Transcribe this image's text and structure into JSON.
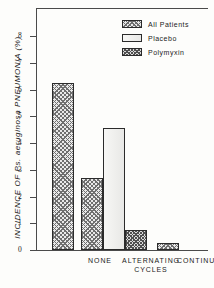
{
  "chart_data": {
    "type": "bar",
    "title": "",
    "xlabel": "",
    "ylabel": "INCIDENCE OF Ps. aeruginosa PNEUMONIA (%)",
    "ylabel_parts": {
      "prefix": "INCIDENCE OF ",
      "species": "Ps. aeruginosa",
      "suffix": " PNEUMONIA (%)"
    },
    "categories": [
      "NONE",
      "ALTERNATING\nCYCLES",
      "CONTINUOUS"
    ],
    "category_labels_flat": [
      "NONE",
      "ALTERNATING CYCLES",
      "CONTINUOUS"
    ],
    "series": [
      {
        "name": "All Patients",
        "values": [
          6.25,
          2.7,
          0.25
        ],
        "fill": "coarse-crosshatch"
      },
      {
        "name": "Placebo",
        "values": [
          null,
          4.55,
          null
        ],
        "fill": "empty-white"
      },
      {
        "name": "Polymyxin",
        "values": [
          null,
          0.75,
          null
        ],
        "fill": "dense-crosshatch"
      }
    ],
    "ylim": [
      0,
      8
    ],
    "yticks": [
      0,
      1,
      2,
      3,
      4,
      5,
      6,
      7,
      8
    ],
    "ytick_labels": [
      "0",
      "1",
      "2",
      "3",
      "4",
      "5",
      "6",
      "7",
      "8"
    ],
    "grid": false,
    "legend_position": "top-right",
    "frame": "top-and-left-rules-only"
  },
  "legend": {
    "entries": [
      {
        "label": "All Patients"
      },
      {
        "label": "Placebo"
      },
      {
        "label": "Polymyxin"
      }
    ]
  },
  "colors": {
    "ink": "#2b2b2b",
    "axis": "#4a4a4a",
    "background": "#fdfdfb",
    "hatch_light": "#6f6f6f",
    "hatch_dark": "#4f4f4f",
    "placebo_fill": "#f3f3f1"
  }
}
